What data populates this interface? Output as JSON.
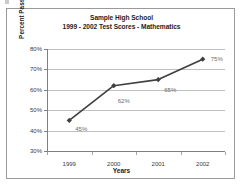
{
  "chart_data": {
    "type": "line",
    "title": "Sample High School",
    "subtitle": "1999 - 2002 Test Scores - Mathematics",
    "xlabel": "Years",
    "ylabel": "Percent Passing",
    "categories": [
      "1999",
      "2000",
      "2001",
      "2002"
    ],
    "values": [
      45,
      62,
      65,
      75
    ],
    "point_labels": [
      "45%",
      "62%",
      "65%",
      "75%"
    ],
    "ylim": [
      30,
      80
    ],
    "ytick_values": [
      80,
      70,
      60,
      50,
      40,
      30
    ],
    "ytick_labels": [
      "80%",
      "70%",
      "60%",
      "50%",
      "40%",
      "30%"
    ],
    "grid": true,
    "legend": "none",
    "series_color": "#3f3f3f",
    "marker": "diamond",
    "label_color": "#6b6b6b",
    "gridline_color": "#c0c0c0",
    "axis_color": "#808080",
    "border_color": "#9a9a9a",
    "background_color": "#ffffff"
  }
}
